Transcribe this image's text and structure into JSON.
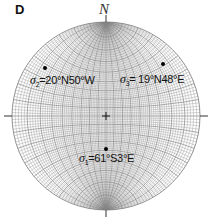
{
  "panel": {
    "label": "D"
  },
  "north": {
    "label": "N"
  },
  "stereonet": {
    "center": [
      106,
      116
    ],
    "radius": 94,
    "grid_color": "#888888"
  },
  "stresses": [
    {
      "symbol": "σ",
      "sub": "2",
      "text": "=20°N50°W",
      "point": [
        45,
        68
      ]
    },
    {
      "symbol": "σ",
      "sub": "3",
      "text": "= 19°N48°E",
      "point": [
        163,
        64
      ]
    },
    {
      "symbol": "σ",
      "sub": "1",
      "text": "=61°S3°E",
      "point": [
        106,
        149
      ]
    }
  ]
}
